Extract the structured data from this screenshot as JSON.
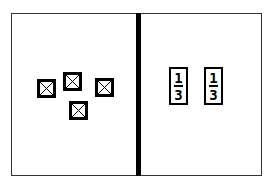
{
  "diagram": {
    "left_panel": {
      "items": [
        {
          "icon": "crossed-box-icon"
        },
        {
          "icon": "crossed-box-icon"
        },
        {
          "icon": "crossed-box-icon"
        },
        {
          "icon": "crossed-box-icon"
        }
      ]
    },
    "right_panel": {
      "cards": [
        {
          "top": "1",
          "bottom": "3"
        },
        {
          "top": "1",
          "bottom": "3"
        }
      ]
    },
    "colors": {
      "stroke": "#000000",
      "frame": "#333333",
      "background": "#ffffff"
    }
  }
}
